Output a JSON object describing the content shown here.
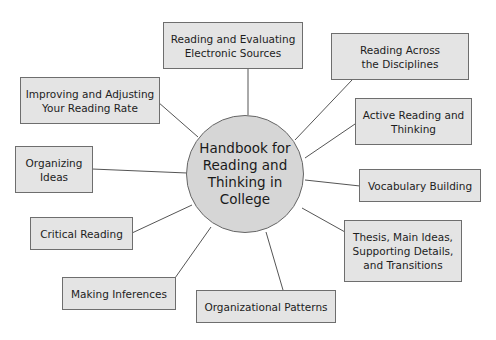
{
  "diagram": {
    "hub": {
      "lines": [
        "Handbook for",
        "Reading and",
        "Thinking in",
        "College"
      ],
      "fill": "#d6d6d6"
    },
    "nodes": [
      {
        "id": "electronic-sources",
        "lines": [
          "Reading and Evaluating",
          "Electronic Sources"
        ]
      },
      {
        "id": "across-disciplines",
        "lines": [
          "Reading Across",
          "the Disciplines"
        ]
      },
      {
        "id": "active-reading",
        "lines": [
          "Active Reading and",
          "Thinking"
        ]
      },
      {
        "id": "vocabulary",
        "lines": [
          "Vocabulary Building"
        ]
      },
      {
        "id": "thesis-main-ideas",
        "lines": [
          "Thesis, Main Ideas,",
          "Supporting Details,",
          "and Transitions"
        ]
      },
      {
        "id": "organizational-patterns",
        "lines": [
          "Organizational Patterns"
        ]
      },
      {
        "id": "making-inferences",
        "lines": [
          "Making Inferences"
        ]
      },
      {
        "id": "critical-reading",
        "lines": [
          "Critical Reading"
        ]
      },
      {
        "id": "organizing-ideas",
        "lines": [
          "Organizing",
          "Ideas"
        ]
      },
      {
        "id": "reading-rate",
        "lines": [
          "Improving and Adjusting",
          "Your Reading Rate"
        ]
      }
    ],
    "colors": {
      "box_fill": "#e4e4e4",
      "border": "#6e6e6e",
      "line": "#555555"
    }
  }
}
